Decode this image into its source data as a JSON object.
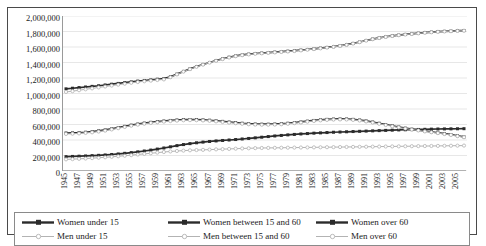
{
  "chart_data": {
    "type": "line",
    "title": "",
    "xlabel": "",
    "ylabel": "",
    "ylim": [
      0,
      2000000
    ],
    "ytick_labels": [
      "2,000,000",
      "1,800,000",
      "1,600,000",
      "1,400,000",
      "1,200,000",
      "1,000,000",
      "800,000",
      "600,000",
      "400,000",
      "200,000",
      "0"
    ],
    "ytick_values": [
      2000000,
      1800000,
      1600000,
      1400000,
      1200000,
      1000000,
      800000,
      600000,
      400000,
      200000,
      0
    ],
    "grid": true,
    "legend_position": "bottom",
    "x": [
      1945,
      1946,
      1947,
      1948,
      1949,
      1950,
      1951,
      1952,
      1953,
      1954,
      1955,
      1956,
      1957,
      1958,
      1959,
      1960,
      1961,
      1962,
      1963,
      1964,
      1965,
      1966,
      1967,
      1968,
      1969,
      1970,
      1971,
      1972,
      1973,
      1974,
      1975,
      1976,
      1977,
      1978,
      1979,
      1980,
      1981,
      1982,
      1983,
      1984,
      1985,
      1986,
      1987,
      1988,
      1989,
      1990,
      1991,
      1992,
      1993,
      1994,
      1995,
      1996,
      1997,
      1998,
      1999,
      2000,
      2001,
      2002,
      2003,
      2004,
      2005,
      2006
    ],
    "xtick_labels": [
      "1945",
      "1947",
      "1949",
      "1951",
      "1953",
      "1955",
      "1957",
      "1959",
      "1961",
      "1963",
      "1965",
      "1967",
      "1969",
      "1971",
      "1973",
      "1975",
      "1977",
      "1979",
      "1981",
      "1983",
      "1985",
      "1987",
      "1989",
      "1991",
      "1993",
      "1995",
      "1997",
      "1999",
      "2001",
      "2003",
      "2005"
    ],
    "series": [
      {
        "name": "Women under 15",
        "color": "#2b2b2b",
        "style": "thick-black-diamond",
        "values": [
          185000,
          188000,
          191000,
          194000,
          198000,
          202000,
          207000,
          213000,
          220000,
          228000,
          237000,
          247000,
          258000,
          270000,
          283000,
          297000,
          312000,
          327000,
          341000,
          353000,
          364000,
          373000,
          381000,
          388000,
          394000,
          400000,
          406000,
          413000,
          420000,
          428000,
          436000,
          444000,
          452000,
          459000,
          466000,
          472000,
          478000,
          483000,
          488000,
          492000,
          496000,
          500000,
          503000,
          506000,
          509000,
          512000,
          515000,
          518000,
          521000,
          524000,
          527000,
          530000,
          532000,
          534000,
          536000,
          538000,
          540000,
          542000,
          543000,
          544000,
          545000,
          546000
        ]
      },
      {
        "name": "Women between 15 and 60",
        "color": "#2b2b2b",
        "style": "thick-black-diamond",
        "values": [
          1060000,
          1068000,
          1076000,
          1084000,
          1092000,
          1100000,
          1110000,
          1120000,
          1130000,
          1140000,
          1150000,
          1160000,
          1168000,
          1176000,
          1184000,
          1192000,
          1215000,
          1250000,
          1285000,
          1318000,
          1348000,
          1375000,
          1400000,
          1425000,
          1448000,
          1468000,
          1485000,
          1498000,
          1508000,
          1516000,
          1522000,
          1528000,
          1534000,
          1540000,
          1546000,
          1552000,
          1560000,
          1568000,
          1576000,
          1585000,
          1594000,
          1604000,
          1616000,
          1630000,
          1646000,
          1664000,
          1684000,
          1702000,
          1718000,
          1732000,
          1744000,
          1754000,
          1762000,
          1770000,
          1778000,
          1786000,
          1792000,
          1798000,
          1802000,
          1806000,
          1810000,
          1812000
        ]
      },
      {
        "name": "Women over 60",
        "color": "#2b2b2b",
        "style": "thick-black-diamond",
        "values": [
          490000,
          492000,
          495000,
          500000,
          508000,
          518000,
          530000,
          544000,
          560000,
          576000,
          592000,
          606000,
          618000,
          628000,
          637000,
          645000,
          652000,
          658000,
          662000,
          664000,
          663000,
          660000,
          655000,
          648000,
          640000,
          632000,
          624000,
          616000,
          610000,
          606000,
          604000,
          604000,
          606000,
          610000,
          616000,
          624000,
          633000,
          643000,
          652000,
          660000,
          666000,
          670000,
          672000,
          671000,
          666000,
          658000,
          646000,
          632000,
          616000,
          600000,
          584000,
          568000,
          553000,
          540000,
          528000,
          516000,
          505000,
          494000,
          482000,
          470000,
          455000,
          440000
        ]
      },
      {
        "name": "Men under 15",
        "color": "#b3b3b3",
        "style": "thin-gray-circle",
        "values": [
          478000,
          481000,
          485000,
          491000,
          499000,
          509000,
          521000,
          536000,
          552000,
          568000,
          584000,
          598000,
          610000,
          620000,
          629000,
          637000,
          644000,
          650000,
          654000,
          656000,
          655000,
          652000,
          647000,
          640000,
          632000,
          624000,
          616000,
          609000,
          603000,
          599000,
          597000,
          597000,
          599000,
          603000,
          609000,
          617000,
          626000,
          636000,
          645000,
          653000,
          659000,
          663000,
          665000,
          664000,
          659000,
          651000,
          639000,
          625000,
          609000,
          593000,
          577000,
          562000,
          548000,
          535000,
          523000,
          511000,
          500000,
          489000,
          477000,
          465000,
          450000,
          436000
        ]
      },
      {
        "name": "Men between 15 and 60",
        "color": "#b3b3b3",
        "style": "thin-gray-circle",
        "values": [
          1020000,
          1030000,
          1042000,
          1054000,
          1066000,
          1078000,
          1090000,
          1102000,
          1114000,
          1126000,
          1138000,
          1148000,
          1158000,
          1166000,
          1174000,
          1182000,
          1210000,
          1246000,
          1282000,
          1314000,
          1344000,
          1372000,
          1398000,
          1422000,
          1444000,
          1464000,
          1481000,
          1494000,
          1504000,
          1512000,
          1518000,
          1524000,
          1530000,
          1536000,
          1542000,
          1548000,
          1556000,
          1564000,
          1573000,
          1582000,
          1592000,
          1602000,
          1614000,
          1628000,
          1644000,
          1662000,
          1682000,
          1700000,
          1716000,
          1730000,
          1742000,
          1752000,
          1760000,
          1768000,
          1776000,
          1784000,
          1790000,
          1796000,
          1800000,
          1804000,
          1808000,
          1810000
        ]
      },
      {
        "name": "Men over 60",
        "color": "#b3b3b3",
        "style": "thin-gray-circle",
        "values": [
          150000,
          153000,
          157000,
          161000,
          166000,
          171000,
          177000,
          183000,
          190000,
          197000,
          205000,
          213000,
          221000,
          229000,
          237000,
          245000,
          252000,
          258000,
          263000,
          267000,
          270000,
          273000,
          276000,
          279000,
          282000,
          285000,
          288000,
          291000,
          293000,
          295000,
          297000,
          298000,
          299000,
          300000,
          301000,
          302000,
          303000,
          304000,
          305000,
          306000,
          307000,
          308000,
          309000,
          310000,
          311000,
          312000,
          313000,
          314000,
          315000,
          316000,
          317000,
          318000,
          319000,
          320000,
          321000,
          322000,
          323000,
          324000,
          325000,
          326000,
          327000,
          328000
        ]
      }
    ]
  },
  "legend": {
    "items": [
      {
        "label": "Women under 15"
      },
      {
        "label": "Women between 15 and 60"
      },
      {
        "label": "Women over 60"
      },
      {
        "label": "Men under 15"
      },
      {
        "label": "Men between 15 and 60"
      },
      {
        "label": "Men over 60"
      }
    ]
  }
}
